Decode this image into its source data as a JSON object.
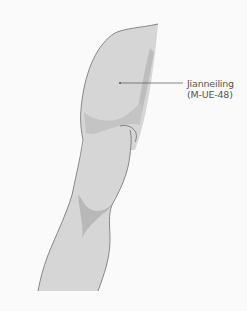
{
  "diagram": {
    "point": {
      "name": "Jianneiling",
      "code": "(M-UE-48)"
    },
    "colors": {
      "background": "#fafafa",
      "skin": "#d6d6d6",
      "shadow": "#bdbdbd",
      "outline": "#6e6e6e",
      "leader_line": "#555555",
      "label_text": "#555555"
    }
  }
}
